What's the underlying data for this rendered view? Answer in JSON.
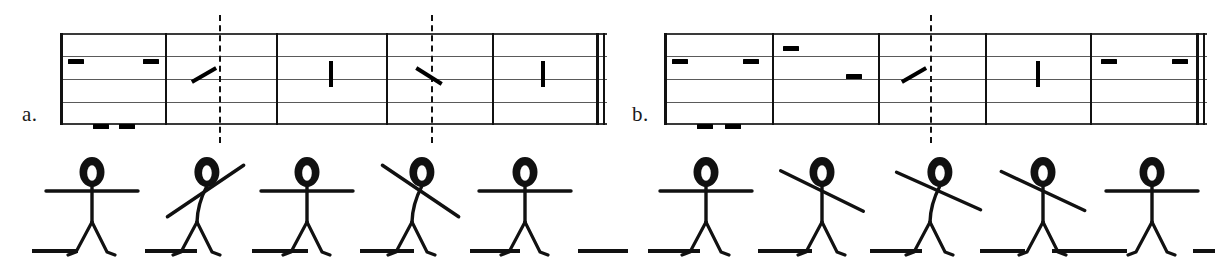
{
  "figure": {
    "caption_a": "a.",
    "caption_b": "b."
  },
  "systems": [
    {
      "id": "a",
      "label": "a.",
      "label_x": 22,
      "label_y": 108,
      "staff_left": 60,
      "staff_right": 607,
      "staff_lines": 5,
      "barlines": [
        60,
        165,
        276,
        386,
        492
      ],
      "end_barline": {
        "thick_x": 596,
        "thin_x": 603
      },
      "dashed_lines": [
        219,
        431
      ],
      "measures": [
        {
          "index": 1,
          "marks": [
            {
              "type": "dash",
              "x": 68,
              "y": 26,
              "w": 16
            },
            {
              "type": "dash",
              "x": 143,
              "y": 26,
              "w": 16
            },
            {
              "type": "dash",
              "x": 93,
              "y": 91,
              "w": 16
            },
            {
              "type": "dash",
              "x": 119,
              "y": 91,
              "w": 16
            }
          ]
        },
        {
          "index": 2,
          "marks": [
            {
              "type": "diagonal",
              "x": 202,
              "y": 28,
              "len": 28,
              "angle": 60
            }
          ]
        },
        {
          "index": 3,
          "marks": [
            {
              "type": "vertical",
              "x": 329,
              "y": 28,
              "len": 26
            }
          ]
        },
        {
          "index": 4,
          "marks": [
            {
              "type": "diagonal",
              "x": 427,
              "y": 28,
              "len": 30,
              "angle": -58
            }
          ]
        },
        {
          "index": 5,
          "marks": [
            {
              "type": "vertical",
              "x": 541,
              "y": 28,
              "len": 26
            }
          ]
        }
      ]
    },
    {
      "id": "b",
      "label": "b.",
      "label_x": 632,
      "label_y": 108,
      "staff_left": 664,
      "staff_right": 1207,
      "staff_lines": 5,
      "barlines": [
        664,
        772,
        878,
        985,
        1090
      ],
      "end_barline": {
        "thick_x": 1196,
        "thin_x": 1203
      },
      "dashed_lines": [
        930
      ],
      "measures": [
        {
          "index": 1,
          "marks": [
            {
              "type": "dash",
              "x": 672,
              "y": 26,
              "w": 16
            },
            {
              "type": "dash",
              "x": 743,
              "y": 26,
              "w": 16
            },
            {
              "type": "dash",
              "x": 697,
              "y": 91,
              "w": 16
            },
            {
              "type": "dash",
              "x": 725,
              "y": 91,
              "w": 16
            }
          ]
        },
        {
          "index": 2,
          "marks": [
            {
              "type": "dash",
              "x": 783,
              "y": 13,
              "w": 16
            },
            {
              "type": "dash",
              "x": 846,
              "y": 41,
              "w": 16
            }
          ]
        },
        {
          "index": 3,
          "marks": [
            {
              "type": "diagonal",
              "x": 912,
              "y": 28,
              "len": 28,
              "angle": 60
            }
          ]
        },
        {
          "index": 4,
          "marks": [
            {
              "type": "vertical",
              "x": 1036,
              "y": 28,
              "len": 26
            }
          ]
        },
        {
          "index": 5,
          "marks": [
            {
              "type": "dash",
              "x": 1101,
              "y": 26,
              "w": 16
            },
            {
              "type": "dash",
              "x": 1172,
              "y": 26,
              "w": 16
            }
          ]
        }
      ]
    }
  ],
  "stick_figures": [
    {
      "index": 1,
      "x": 92,
      "pose": "arms-horizontal",
      "arm_angle": 0,
      "body_lean": 0,
      "head_fill": "shaded"
    },
    {
      "index": 2,
      "x": 197,
      "pose": "arms-diagonal-up-right",
      "arm_angle": -34,
      "body_lean": 9,
      "head_fill": "shaded"
    },
    {
      "index": 3,
      "x": 307,
      "pose": "arms-horizontal",
      "arm_angle": 0,
      "body_lean": 0,
      "head_fill": "shaded"
    },
    {
      "index": 4,
      "x": 412,
      "pose": "arms-diagonal-down-right",
      "arm_angle": 34,
      "body_lean": 9,
      "head_fill": "shaded"
    },
    {
      "index": 5,
      "x": 525,
      "pose": "arms-horizontal",
      "arm_angle": 0,
      "body_lean": 0,
      "head_fill": "shaded"
    },
    {
      "index": 6,
      "x": 706,
      "pose": "arms-horizontal",
      "arm_angle": 0,
      "body_lean": 0,
      "head_fill": "shaded"
    },
    {
      "index": 7,
      "x": 822,
      "pose": "arms-diagonal-down-right",
      "arm_angle": 26,
      "body_lean": 0,
      "head_fill": "shaded"
    },
    {
      "index": 8,
      "x": 930,
      "pose": "arms-diagonal-down-right",
      "arm_angle": 24,
      "body_lean": 9,
      "head_fill": "shaded"
    },
    {
      "index": 9,
      "x": 1043,
      "pose": "arms-diagonal-down-right",
      "arm_angle": 25,
      "body_lean": 0,
      "head_fill": "shaded"
    },
    {
      "index": 10,
      "x": 1152,
      "pose": "arms-horizontal",
      "arm_angle": 0,
      "body_lean": 0,
      "head_fill": "shaded"
    }
  ],
  "ground_dashes": [
    {
      "x": 32,
      "w": 46
    },
    {
      "x": 145,
      "w": 52
    },
    {
      "x": 252,
      "w": 56
    },
    {
      "x": 360,
      "w": 54
    },
    {
      "x": 470,
      "w": 50
    },
    {
      "x": 578,
      "w": 50
    },
    {
      "x": 648,
      "w": 52
    },
    {
      "x": 758,
      "w": 54
    },
    {
      "x": 870,
      "w": 52
    },
    {
      "x": 980,
      "w": 45
    },
    {
      "x": 1052,
      "w": 44
    },
    {
      "x": 1087,
      "w": 40
    },
    {
      "x": 1193,
      "w": 22
    }
  ],
  "colors": {
    "ink": "#111111",
    "staff_line": "#5a5a5a",
    "background": "#ffffff"
  }
}
